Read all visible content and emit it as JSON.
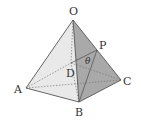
{
  "diagram": {
    "type": "square pyramid",
    "points": {
      "O": {
        "label": "O",
        "x": 73,
        "y": 20
      },
      "A": {
        "label": "A",
        "x": 26,
        "y": 88
      },
      "B": {
        "label": "B",
        "x": 79,
        "y": 102
      },
      "C": {
        "label": "C",
        "x": 121,
        "y": 80
      },
      "D": {
        "label": "D",
        "x": 71,
        "y": 63
      },
      "P": {
        "label": "P",
        "x": 97,
        "y": 50
      }
    },
    "angle_label": "θ",
    "colors": {
      "face_left": "#e9e9e9",
      "face_right": "#a9a9a9",
      "face_back": "#d6d6d6",
      "edge": "#555555",
      "hidden_edge": "#777777"
    }
  }
}
